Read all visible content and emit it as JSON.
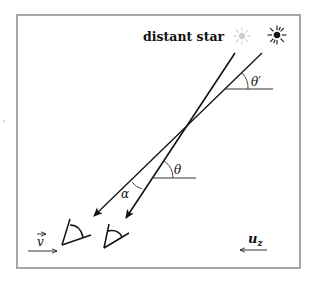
{
  "diagram": {
    "title_label": "distant star",
    "labels": {
      "theta_prime": "θ′",
      "theta": "θ",
      "alpha": "α",
      "velocity": "v",
      "velocity_arrow_accent": "⃗",
      "uz_main": "u",
      "uz_sub": "z"
    },
    "colors": {
      "frame": "#a6a6a6",
      "lines": "#111111",
      "ghost_star": "#cfcfcf",
      "real_star": "#111111",
      "background": "#ffffff"
    },
    "elements": {
      "ghost_star": "apparent-star-position",
      "real_star": "true-star-position",
      "steep_ray": "light-ray-rest-frame",
      "shallow_ray": "light-ray-moving-frame",
      "eye_left": "observer-eye-moving",
      "eye_right": "observer-eye-rest"
    }
  }
}
